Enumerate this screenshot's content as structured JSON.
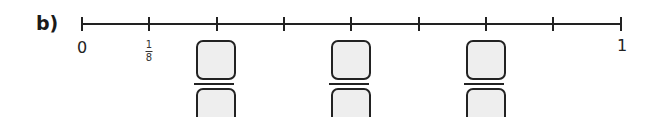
{
  "question": {
    "label": "b)"
  },
  "number_line": {
    "start_x": 82,
    "end_x": 621,
    "tick_count": 9,
    "labels": {
      "zero": "0",
      "one": "1",
      "first_fraction": {
        "numerator": "1",
        "denominator": "8"
      }
    },
    "answer_boxes": [
      {
        "tick_index": 2,
        "numerator": "",
        "denominator": ""
      },
      {
        "tick_index": 4,
        "numerator": "",
        "denominator": ""
      },
      {
        "tick_index": 6,
        "numerator": "",
        "denominator": ""
      }
    ]
  },
  "colors": {
    "line": "#222222",
    "box_fill": "#eeeeee"
  }
}
